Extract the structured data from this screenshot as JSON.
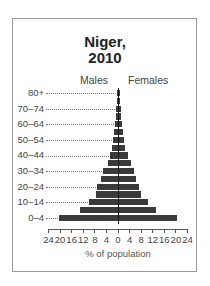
{
  "chart_data": {
    "type": "bar",
    "subtype": "population-pyramid",
    "title_lines": [
      "Niger,",
      "2010"
    ],
    "legend": [
      "Males",
      "Females"
    ],
    "xlabel": "% of population",
    "ylabel": "",
    "xlim": [
      -24,
      24
    ],
    "x_ticks": [
      "24",
      "20",
      "16",
      "12",
      "8",
      "4",
      "0",
      "4",
      "8",
      "12",
      "16",
      "20",
      "24"
    ],
    "age_tick_labels": [
      "80+",
      "70–74",
      "60–64",
      "50–54",
      "40–44",
      "30–34",
      "20–24",
      "10–14",
      "0–4"
    ],
    "categories": [
      "80+",
      "75–79",
      "70–74",
      "65–69",
      "60–64",
      "55–59",
      "50–54",
      "45–49",
      "40–44",
      "35–39",
      "30–34",
      "25–29",
      "20–24",
      "15–19",
      "10–14",
      "5–9",
      "0–4"
    ],
    "series": [
      {
        "name": "Males",
        "values": [
          0.3,
          0.4,
          0.6,
          0.8,
          1.1,
          1.4,
          1.8,
          2.2,
          2.8,
          3.5,
          5.1,
          6.0,
          7.2,
          7.6,
          10.2,
          13.1,
          20.5
        ]
      },
      {
        "name": "Females",
        "values": [
          0.3,
          0.4,
          0.6,
          0.8,
          1.1,
          1.4,
          1.8,
          2.2,
          3.0,
          4.1,
          5.1,
          6.0,
          6.9,
          7.6,
          10.2,
          13.0,
          20.0
        ]
      }
    ],
    "grid": false,
    "colors": {
      "bars": "#3a3a3a",
      "axis": "#111111",
      "frame": "#9a9a9a"
    }
  }
}
